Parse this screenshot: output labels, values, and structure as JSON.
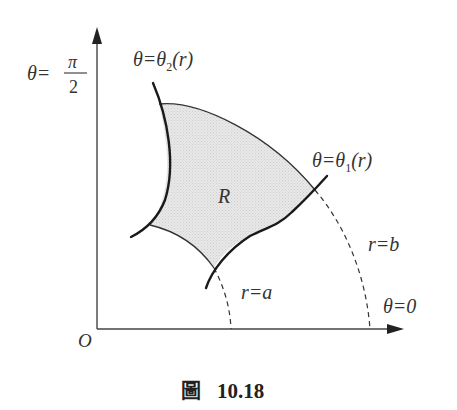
{
  "figure": {
    "caption": {
      "prefix": "圖",
      "number": "10.18"
    },
    "labels": {
      "origin": "O",
      "theta_pi_over_2": {
        "lhs": "θ=",
        "numerator": "π",
        "denominator": "2"
      },
      "theta_2": {
        "lhs": "θ=θ",
        "subscript": "2",
        "arg": "(r)"
      },
      "theta_1": {
        "lhs": "θ=θ",
        "subscript": "1",
        "arg": "(r)"
      },
      "r_equals_b": "r=b",
      "r_equals_a": "r=a",
      "theta_zero": "θ=0",
      "region": "R"
    },
    "colors": {
      "stroke": "#222222",
      "region_fill": "#e4e4e4",
      "text": "#333333"
    }
  }
}
